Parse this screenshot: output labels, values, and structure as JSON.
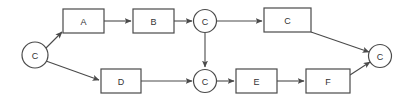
{
  "diagram": {
    "type": "flowchart",
    "title": "",
    "background_color": "#ffffff",
    "stroke_color": "#4a4a4a",
    "label_color": "#333333",
    "nodes": [
      {
        "id": "start",
        "label": "C",
        "shape": "circle",
        "cx": 35,
        "cy": 55,
        "r": 13
      },
      {
        "id": "a",
        "label": "A",
        "shape": "rect",
        "x": 63,
        "y": 9,
        "w": 41,
        "h": 24
      },
      {
        "id": "b",
        "label": "B",
        "shape": "rect",
        "x": 133,
        "y": 9,
        "w": 41,
        "h": 24
      },
      {
        "id": "mid_top",
        "label": "C",
        "shape": "circle",
        "cx": 205,
        "cy": 21,
        "r": 11.5
      },
      {
        "id": "c_box",
        "label": "C",
        "shape": "rect",
        "x": 264,
        "y": 8,
        "w": 47,
        "h": 24
      },
      {
        "id": "d",
        "label": "D",
        "shape": "rect",
        "x": 101,
        "y": 69,
        "w": 40,
        "h": 24
      },
      {
        "id": "mid_bottom",
        "label": "C",
        "shape": "circle",
        "cx": 205,
        "cy": 81,
        "r": 11.5
      },
      {
        "id": "e",
        "label": "E",
        "shape": "rect",
        "x": 236,
        "y": 69,
        "w": 41,
        "h": 24
      },
      {
        "id": "f",
        "label": "F",
        "shape": "rect",
        "x": 306,
        "y": 69,
        "w": 44,
        "h": 24
      },
      {
        "id": "end",
        "label": "C",
        "shape": "circle",
        "cx": 380,
        "cy": 56,
        "r": 11.5
      }
    ],
    "edges": [
      {
        "id": "start-a",
        "from": "start",
        "to": "a",
        "points": "46,48 62,32",
        "arrow": true
      },
      {
        "id": "start-d",
        "from": "start",
        "to": "d",
        "points": "46,61 99,80",
        "arrow": true
      },
      {
        "id": "a-b",
        "from": "a",
        "to": "b",
        "points": "104,21 131,21",
        "arrow": true
      },
      {
        "id": "b-midtop",
        "from": "b",
        "to": "mid_top",
        "points": "174,21 192,21",
        "arrow": true
      },
      {
        "id": "midtop-cbox",
        "from": "mid_top",
        "to": "c_box",
        "points": "217,21 262,21",
        "arrow": true
      },
      {
        "id": "midtop-midbottom",
        "from": "mid_top",
        "to": "mid_bottom",
        "points": "205,33 205,67",
        "arrow": true
      },
      {
        "id": "cbox-end",
        "from": "c_box",
        "to": "end",
        "points": "311,32 369,52",
        "arrow": true
      },
      {
        "id": "d-midbottom",
        "from": "d",
        "to": "mid_bottom",
        "points": "141,81 192,81",
        "arrow": true
      },
      {
        "id": "midbottom-e",
        "from": "mid_bottom",
        "to": "e",
        "points": "217,81 234,81",
        "arrow": true
      },
      {
        "id": "e-f",
        "from": "e",
        "to": "f",
        "points": "277,81 304,81",
        "arrow": true
      },
      {
        "id": "f-end",
        "from": "f",
        "to": "end",
        "points": "350,75 370,62",
        "arrow": true
      }
    ]
  }
}
